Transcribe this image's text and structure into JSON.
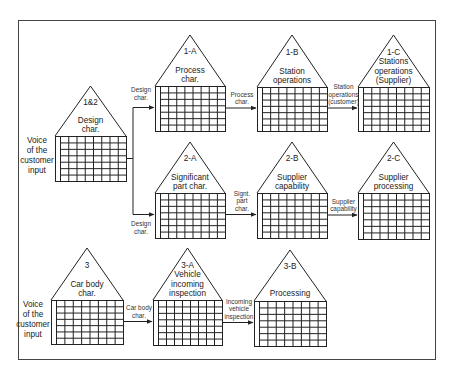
{
  "diagram": {
    "houses": [
      {
        "id": "h12",
        "code": "1&2",
        "title": [
          "Design",
          "char."
        ],
        "side_label": [
          "Voice",
          "of the",
          "customer",
          "input"
        ]
      },
      {
        "id": "h1a",
        "code": "1-A",
        "title": [
          "Process",
          "char."
        ]
      },
      {
        "id": "h1b",
        "code": "1-B",
        "title": [
          "Station",
          "operations"
        ]
      },
      {
        "id": "h1c",
        "code": "1-C",
        "title": [
          "Stations",
          "operations",
          "(Supplier)"
        ]
      },
      {
        "id": "h2a",
        "code": "2-A",
        "title": [
          "Significant",
          "part char."
        ]
      },
      {
        "id": "h2b",
        "code": "2-B",
        "title": [
          "Supplier",
          "capability"
        ]
      },
      {
        "id": "h2c",
        "code": "2-C",
        "title": [
          "Supplier",
          "processing"
        ]
      },
      {
        "id": "h3",
        "code": "3",
        "title": [
          "Car body",
          "char."
        ],
        "side_label": [
          "Voice",
          "of the",
          "customer",
          "input"
        ]
      },
      {
        "id": "h3a",
        "code": "3-A",
        "title": [
          "Vehicle",
          "incoming",
          "inspection"
        ]
      },
      {
        "id": "h3b",
        "code": "3-B",
        "title": [
          "Processing"
        ]
      }
    ],
    "connectors": [
      {
        "from": "h12",
        "to": "h1a",
        "label": [
          "Design",
          "char."
        ]
      },
      {
        "from": "h12",
        "to": "h2a",
        "label": [
          "Design",
          "char."
        ]
      },
      {
        "from": "h1a",
        "to": "h1b",
        "label": [
          "Process",
          "char."
        ]
      },
      {
        "from": "h1b",
        "to": "h1c",
        "label": [
          "Station",
          "operations",
          "(customer)"
        ]
      },
      {
        "from": "h2a",
        "to": "h2b",
        "label": [
          "Signt.",
          "part",
          "char."
        ]
      },
      {
        "from": "h2b",
        "to": "h2c",
        "label": [
          "Supplier",
          "capability"
        ]
      },
      {
        "from": "h3",
        "to": "h3a",
        "label": [
          "Car body",
          "char."
        ]
      },
      {
        "from": "h3a",
        "to": "h3b",
        "label": [
          "Incoming",
          "vehicle",
          "inspection"
        ]
      }
    ],
    "grid": {
      "columns": 8,
      "rows": 7
    }
  }
}
